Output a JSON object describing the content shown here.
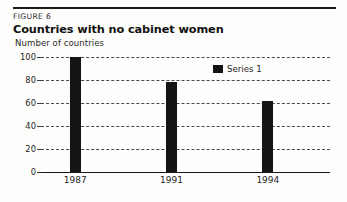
{
  "figure": {
    "label": "FIGURE 6",
    "title": "Countries with no cabinet women",
    "subtitle": "Number of countries"
  },
  "chart_data": {
    "type": "bar",
    "title": "Countries with no cabinet women",
    "subtitle": "Number of countries",
    "xlabel": "",
    "ylabel": "Number of countries",
    "categories": [
      "1987",
      "1991",
      "1994"
    ],
    "values": [
      100,
      78,
      62
    ],
    "series": [
      {
        "name": "Series 1",
        "values": [
          100,
          78,
          62
        ]
      }
    ],
    "ylim": [
      0,
      100
    ],
    "yticks": [
      0,
      20,
      40,
      60,
      80,
      100
    ],
    "ytick_labels": [
      "0",
      "20",
      "40",
      "60",
      "80",
      "100"
    ],
    "grid": true,
    "grid_style": "dashed-horizontal",
    "legend": {
      "position": "top-right-inside",
      "entries": [
        "Series 1"
      ]
    },
    "bar_color": "#141414"
  },
  "legend": {
    "series_label": "Series 1"
  }
}
